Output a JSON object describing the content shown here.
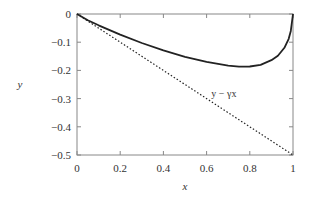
{
  "chart_data": {
    "type": "line",
    "title": "",
    "xlabel": "x",
    "ylabel": "y",
    "xlim": [
      0,
      1
    ],
    "ylim": [
      -0.5,
      0
    ],
    "grid": false,
    "legend": null,
    "x_ticks": [
      0,
      0.2,
      0.4,
      0.6,
      0.8,
      1
    ],
    "x_tick_labels": [
      "0",
      "0.2",
      "0.4",
      "0.6",
      "0.8",
      "1"
    ],
    "y_ticks": [
      0,
      -0.1,
      -0.2,
      -0.3,
      -0.4,
      -0.5
    ],
    "y_tick_labels": [
      "0",
      "−0.1",
      "−0.2",
      "−0.3",
      "−0.4",
      "−0.5"
    ],
    "series": [
      {
        "name": "curve",
        "style": "solid",
        "color": "#222222",
        "x": [
          0,
          0.05,
          0.1,
          0.2,
          0.3,
          0.4,
          0.5,
          0.6,
          0.7,
          0.75,
          0.8,
          0.85,
          0.9,
          0.93,
          0.96,
          0.98,
          0.99,
          1.0
        ],
        "y": [
          0,
          -0.022,
          -0.04,
          -0.073,
          -0.103,
          -0.129,
          -0.152,
          -0.17,
          -0.183,
          -0.187,
          -0.186,
          -0.18,
          -0.164,
          -0.148,
          -0.12,
          -0.088,
          -0.06,
          0
        ]
      },
      {
        "name": "y − γx",
        "style": "dotted",
        "color": "#222222",
        "x": [
          0,
          1
        ],
        "y": [
          0,
          -0.5
        ]
      }
    ],
    "annotations": [
      {
        "text": "y − γx",
        "x": 0.68,
        "y": -0.28
      }
    ]
  },
  "labels": {
    "xlabel": "x",
    "ylabel": "y",
    "annotation": "y − γx"
  }
}
